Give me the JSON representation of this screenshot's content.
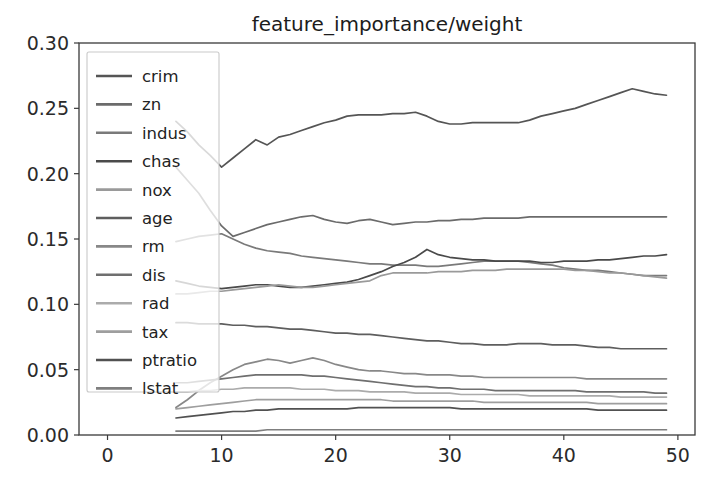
{
  "chart_data": {
    "type": "line",
    "title": "feature_importance/weight",
    "xlabel": "",
    "ylabel": "",
    "xlim": [
      -2.5,
      51.5
    ],
    "ylim": [
      0.0,
      0.3
    ],
    "xticks": [
      0,
      10,
      20,
      30,
      40,
      50
    ],
    "yticks": [
      "0.00",
      "0.05",
      "0.10",
      "0.15",
      "0.20",
      "0.25",
      "0.30"
    ],
    "xtick_labels": [
      "0",
      "10",
      "20",
      "30",
      "40",
      "50"
    ],
    "grid": false,
    "legend_position": "upper left",
    "legend_labels": [
      "crim",
      "zn",
      "indus",
      "chas",
      "nox",
      "age",
      "rm",
      "dis",
      "rad",
      "tax",
      "ptratio",
      "lstat"
    ],
    "x": [
      6,
      7,
      8,
      9,
      10,
      11,
      12,
      13,
      14,
      15,
      16,
      17,
      18,
      19,
      20,
      21,
      22,
      23,
      24,
      25,
      26,
      27,
      28,
      29,
      30,
      31,
      32,
      33,
      34,
      35,
      36,
      37,
      38,
      39,
      40,
      41,
      42,
      43,
      44,
      45,
      46,
      47,
      48,
      49
    ],
    "series": [
      {
        "name": "crim",
        "color": "#555555",
        "values": [
          0.24,
          0.232,
          0.222,
          0.214,
          0.205,
          0.212,
          0.219,
          0.226,
          0.222,
          0.228,
          0.23,
          0.233,
          0.236,
          0.239,
          0.241,
          0.244,
          0.245,
          0.245,
          0.245,
          0.246,
          0.246,
          0.247,
          0.244,
          0.24,
          0.238,
          0.238,
          0.239,
          0.239,
          0.239,
          0.239,
          0.239,
          0.241,
          0.244,
          0.246,
          0.248,
          0.25,
          0.253,
          0.256,
          0.259,
          0.262,
          0.265,
          0.263,
          0.261,
          0.26
        ]
      },
      {
        "name": "zn",
        "color": "#6b6b6b",
        "values": [
          0.205,
          0.195,
          0.185,
          0.172,
          0.16,
          0.152,
          0.155,
          0.158,
          0.161,
          0.163,
          0.165,
          0.167,
          0.168,
          0.165,
          0.163,
          0.162,
          0.164,
          0.165,
          0.163,
          0.161,
          0.162,
          0.163,
          0.163,
          0.164,
          0.164,
          0.165,
          0.165,
          0.166,
          0.166,
          0.166,
          0.166,
          0.167,
          0.167,
          0.167,
          0.167,
          0.167,
          0.167,
          0.167,
          0.167,
          0.167,
          0.167,
          0.167,
          0.167,
          0.167
        ]
      },
      {
        "name": "indus",
        "color": "#7a7a7a",
        "values": [
          0.148,
          0.15,
          0.152,
          0.153,
          0.154,
          0.15,
          0.146,
          0.143,
          0.141,
          0.14,
          0.139,
          0.137,
          0.136,
          0.135,
          0.134,
          0.133,
          0.132,
          0.131,
          0.131,
          0.13,
          0.13,
          0.13,
          0.129,
          0.129,
          0.13,
          0.131,
          0.132,
          0.133,
          0.133,
          0.133,
          0.133,
          0.132,
          0.131,
          0.13,
          0.128,
          0.127,
          0.126,
          0.126,
          0.125,
          0.124,
          0.123,
          0.122,
          0.122,
          0.122
        ]
      },
      {
        "name": "chas",
        "color": "#4a4a4a",
        "values": [
          0.118,
          0.116,
          0.114,
          0.113,
          0.112,
          0.113,
          0.114,
          0.115,
          0.115,
          0.114,
          0.113,
          0.113,
          0.114,
          0.115,
          0.116,
          0.117,
          0.119,
          0.122,
          0.125,
          0.129,
          0.132,
          0.136,
          0.142,
          0.138,
          0.136,
          0.135,
          0.134,
          0.134,
          0.133,
          0.133,
          0.133,
          0.133,
          0.132,
          0.132,
          0.133,
          0.133,
          0.133,
          0.134,
          0.134,
          0.135,
          0.136,
          0.137,
          0.137,
          0.138
        ]
      },
      {
        "name": "nox",
        "color": "#9a9a9a",
        "values": [
          0.108,
          0.108,
          0.109,
          0.11,
          0.11,
          0.111,
          0.112,
          0.113,
          0.114,
          0.115,
          0.114,
          0.113,
          0.113,
          0.114,
          0.115,
          0.116,
          0.117,
          0.118,
          0.122,
          0.124,
          0.124,
          0.124,
          0.124,
          0.125,
          0.125,
          0.125,
          0.126,
          0.126,
          0.126,
          0.127,
          0.127,
          0.127,
          0.127,
          0.127,
          0.127,
          0.126,
          0.126,
          0.125,
          0.124,
          0.124,
          0.123,
          0.122,
          0.121,
          0.12
        ]
      },
      {
        "name": "age",
        "color": "#5e5e5e",
        "values": [
          0.086,
          0.086,
          0.085,
          0.085,
          0.085,
          0.084,
          0.084,
          0.083,
          0.083,
          0.082,
          0.081,
          0.081,
          0.08,
          0.079,
          0.078,
          0.078,
          0.077,
          0.077,
          0.076,
          0.075,
          0.074,
          0.073,
          0.072,
          0.072,
          0.071,
          0.07,
          0.07,
          0.069,
          0.069,
          0.069,
          0.07,
          0.07,
          0.07,
          0.069,
          0.069,
          0.069,
          0.068,
          0.067,
          0.067,
          0.066,
          0.066,
          0.066,
          0.066,
          0.066
        ]
      },
      {
        "name": "rm",
        "color": "#888888",
        "values": [
          0.021,
          0.027,
          0.034,
          0.04,
          0.045,
          0.05,
          0.054,
          0.056,
          0.058,
          0.057,
          0.055,
          0.057,
          0.059,
          0.057,
          0.054,
          0.052,
          0.05,
          0.049,
          0.049,
          0.048,
          0.047,
          0.047,
          0.046,
          0.046,
          0.046,
          0.045,
          0.045,
          0.044,
          0.044,
          0.044,
          0.044,
          0.044,
          0.044,
          0.044,
          0.044,
          0.044,
          0.043,
          0.043,
          0.043,
          0.043,
          0.043,
          0.043,
          0.043,
          0.043
        ]
      },
      {
        "name": "dis",
        "color": "#6f6f6f",
        "values": [
          0.04,
          0.04,
          0.041,
          0.042,
          0.043,
          0.044,
          0.045,
          0.046,
          0.046,
          0.046,
          0.046,
          0.046,
          0.045,
          0.045,
          0.044,
          0.043,
          0.042,
          0.041,
          0.04,
          0.039,
          0.038,
          0.037,
          0.037,
          0.036,
          0.036,
          0.035,
          0.035,
          0.035,
          0.034,
          0.034,
          0.034,
          0.034,
          0.034,
          0.034,
          0.034,
          0.034,
          0.033,
          0.033,
          0.033,
          0.033,
          0.033,
          0.033,
          0.032,
          0.032
        ]
      },
      {
        "name": "rad",
        "color": "#ababab",
        "values": [
          0.033,
          0.033,
          0.034,
          0.034,
          0.035,
          0.035,
          0.036,
          0.036,
          0.036,
          0.036,
          0.036,
          0.035,
          0.035,
          0.035,
          0.034,
          0.034,
          0.034,
          0.033,
          0.033,
          0.033,
          0.033,
          0.032,
          0.032,
          0.032,
          0.032,
          0.031,
          0.031,
          0.031,
          0.031,
          0.031,
          0.031,
          0.03,
          0.03,
          0.03,
          0.03,
          0.03,
          0.03,
          0.03,
          0.03,
          0.029,
          0.029,
          0.029,
          0.029,
          0.029
        ]
      },
      {
        "name": "tax",
        "color": "#9e9e9e",
        "values": [
          0.02,
          0.021,
          0.022,
          0.023,
          0.024,
          0.025,
          0.026,
          0.027,
          0.027,
          0.027,
          0.027,
          0.027,
          0.027,
          0.027,
          0.027,
          0.027,
          0.027,
          0.027,
          0.027,
          0.026,
          0.026,
          0.026,
          0.026,
          0.026,
          0.026,
          0.026,
          0.026,
          0.025,
          0.025,
          0.025,
          0.025,
          0.025,
          0.025,
          0.025,
          0.025,
          0.025,
          0.025,
          0.024,
          0.024,
          0.024,
          0.024,
          0.024,
          0.024,
          0.024
        ]
      },
      {
        "name": "ptratio",
        "color": "#515151",
        "values": [
          0.013,
          0.014,
          0.015,
          0.016,
          0.017,
          0.018,
          0.018,
          0.019,
          0.019,
          0.02,
          0.02,
          0.02,
          0.02,
          0.02,
          0.02,
          0.02,
          0.021,
          0.021,
          0.021,
          0.021,
          0.021,
          0.021,
          0.021,
          0.021,
          0.021,
          0.02,
          0.02,
          0.02,
          0.02,
          0.02,
          0.02,
          0.02,
          0.02,
          0.02,
          0.02,
          0.02,
          0.02,
          0.019,
          0.019,
          0.019,
          0.019,
          0.019,
          0.019,
          0.019
        ]
      },
      {
        "name": "lstat",
        "color": "#7f7f7f",
        "values": [
          0.003,
          0.003,
          0.003,
          0.003,
          0.003,
          0.003,
          0.003,
          0.003,
          0.004,
          0.004,
          0.004,
          0.004,
          0.004,
          0.004,
          0.004,
          0.004,
          0.004,
          0.004,
          0.004,
          0.004,
          0.004,
          0.004,
          0.004,
          0.004,
          0.004,
          0.004,
          0.004,
          0.004,
          0.004,
          0.004,
          0.004,
          0.004,
          0.004,
          0.004,
          0.004,
          0.004,
          0.004,
          0.004,
          0.004,
          0.004,
          0.004,
          0.004,
          0.004,
          0.004
        ]
      }
    ]
  }
}
